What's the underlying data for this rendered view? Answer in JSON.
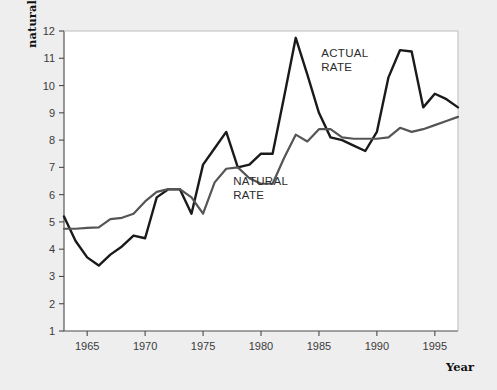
{
  "chart_data": {
    "type": "line",
    "title": "",
    "xlabel": "Year",
    "ylabel": "Actual and natural unemployment rates (percent)",
    "ylabel_lines": [
      "Actual and",
      "natural unemployment rates (percent)"
    ],
    "xlim": [
      1963,
      1997
    ],
    "ylim": [
      1,
      12
    ],
    "xticks": [
      1965,
      1970,
      1975,
      1980,
      1985,
      1990,
      1995
    ],
    "yticks": [
      1,
      2,
      3,
      4,
      5,
      6,
      7,
      8,
      9,
      10,
      11,
      12
    ],
    "grid": false,
    "legend_position": "inline-annotations",
    "x": [
      1963,
      1964,
      1965,
      1966,
      1967,
      1968,
      1969,
      1970,
      1971,
      1972,
      1973,
      1974,
      1975,
      1976,
      1977,
      1978,
      1979,
      1980,
      1981,
      1982,
      1983,
      1984,
      1985,
      1986,
      1987,
      1988,
      1989,
      1990,
      1991,
      1992,
      1993,
      1994,
      1995,
      1996,
      1997
    ],
    "series": [
      {
        "name": "ACTUAL RATE",
        "color": "#1a1a1a",
        "label_x": 1985.2,
        "label_y": 11.05,
        "values": [
          5.2,
          4.3,
          3.7,
          3.4,
          3.8,
          4.1,
          4.5,
          4.4,
          5.9,
          6.2,
          6.2,
          5.3,
          7.1,
          7.7,
          8.3,
          7.0,
          7.1,
          7.5,
          7.5,
          9.6,
          11.75,
          10.4,
          9.0,
          8.1,
          8.0,
          7.8,
          7.6,
          8.3,
          10.3,
          11.3,
          11.25,
          9.2,
          9.7,
          9.5,
          9.2
        ]
      },
      {
        "name": "NATURAL RATE",
        "color": "#555555",
        "label_x": 1977.6,
        "label_y": 6.35,
        "values": [
          4.75,
          4.75,
          4.78,
          4.8,
          5.1,
          5.15,
          5.3,
          5.75,
          6.1,
          6.2,
          6.2,
          5.9,
          5.3,
          6.45,
          6.95,
          7.0,
          6.6,
          6.4,
          6.4,
          7.35,
          8.2,
          7.95,
          8.4,
          8.4,
          8.1,
          8.05,
          8.05,
          8.05,
          8.1,
          8.45,
          8.3,
          8.4,
          8.55,
          8.7,
          8.85
        ]
      }
    ]
  }
}
